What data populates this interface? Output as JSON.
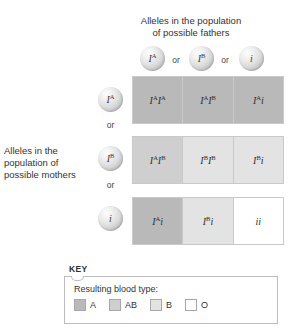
{
  "diagram": {
    "column_caption": "Alleles in the population of possible fathers",
    "column_caption_line1": "Alleles in the population",
    "column_caption_line2": "of possible fathers",
    "row_caption": "Alleles in the population of possible mothers",
    "row_caption_line1": "Alleles in the",
    "row_caption_line2": "population of",
    "row_caption_line3": "possible mothers",
    "separator": "or"
  },
  "father_alleles": [
    {
      "base": "I",
      "sup": "A",
      "name": "allele-IA"
    },
    {
      "base": "I",
      "sup": "B",
      "name": "allele-IB"
    },
    {
      "base": "i",
      "sup": "",
      "name": "allele-i"
    }
  ],
  "mother_alleles": [
    {
      "base": "I",
      "sup": "A",
      "name": "allele-IA"
    },
    {
      "base": "I",
      "sup": "B",
      "name": "allele-IB"
    },
    {
      "base": "i",
      "sup": "",
      "name": "allele-i"
    }
  ],
  "grid": {
    "rows": [
      {
        "mother": "IA",
        "cells": [
          {
            "p1": "I",
            "s1": "A",
            "p2": "I",
            "s2": "A",
            "genotype": "IAIA",
            "blood_type": "A",
            "swatch": "#b9b9b9"
          },
          {
            "p1": "I",
            "s1": "A",
            "p2": "I",
            "s2": "B",
            "genotype": "IAIB",
            "blood_type": "AB",
            "swatch": "#b9b9b9"
          },
          {
            "p1": "I",
            "s1": "A",
            "p2": "i",
            "s2": "",
            "genotype": "IAi",
            "blood_type": "A",
            "swatch": "#b9b9b9"
          }
        ]
      },
      {
        "mother": "IB",
        "cells": [
          {
            "p1": "I",
            "s1": "A",
            "p2": "I",
            "s2": "B",
            "genotype": "IAIB",
            "blood_type": "AB",
            "swatch": "#cfcfcf"
          },
          {
            "p1": "I",
            "s1": "B",
            "p2": "I",
            "s2": "B",
            "genotype": "IBIB",
            "blood_type": "B",
            "swatch": "#e3e3e3"
          },
          {
            "p1": "I",
            "s1": "B",
            "p2": "i",
            "s2": "",
            "genotype": "IBi",
            "blood_type": "B",
            "swatch": "#e3e3e3"
          }
        ]
      },
      {
        "mother": "i",
        "cells": [
          {
            "p1": "I",
            "s1": "A",
            "p2": "i",
            "s2": "",
            "genotype": "IAi",
            "blood_type": "A",
            "swatch": "#b9b9b9"
          },
          {
            "p1": "I",
            "s1": "B",
            "p2": "i",
            "s2": "",
            "genotype": "IBi",
            "blood_type": "B",
            "swatch": "#e3e3e3"
          },
          {
            "p1": "i",
            "s1": "",
            "p2": "i",
            "s2": "",
            "genotype": "ii",
            "blood_type": "O",
            "swatch": "#ffffff"
          }
        ]
      }
    ]
  },
  "key": {
    "title": "KEY",
    "label": "Resulting blood type:",
    "items": [
      {
        "label": "A",
        "color": "#b9b9b9"
      },
      {
        "label": "AB",
        "color": "#cfcfcf"
      },
      {
        "label": "B",
        "color": "#e3e3e3"
      },
      {
        "label": "O",
        "color": "#ffffff"
      }
    ]
  }
}
